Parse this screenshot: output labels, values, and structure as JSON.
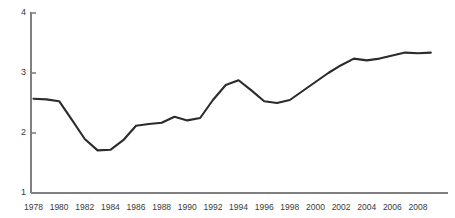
{
  "chart_data": {
    "type": "line",
    "title": "",
    "subtitle": "",
    "xlabel": "",
    "ylabel": "",
    "xlim": [
      1978,
      2009
    ],
    "ylim": [
      1,
      4
    ],
    "grid": false,
    "legend": false,
    "legend_position": "none",
    "line_color": "#2b2b2b",
    "axis_color": "#808080",
    "tick_label_color": "#3a3a3a",
    "y_ticks": [
      "1",
      "2",
      "3",
      "4"
    ],
    "y_tick_values": [
      1,
      2,
      3,
      4
    ],
    "x_ticks": [
      "1978",
      "1980",
      "1982",
      "1984",
      "1986",
      "1988",
      "1990",
      "1992",
      "1994",
      "1996",
      "1998",
      "2000",
      "2002",
      "2004",
      "2006",
      "2008"
    ],
    "x_tick_values": [
      1978,
      1980,
      1982,
      1984,
      1986,
      1988,
      1990,
      1992,
      1994,
      1996,
      1998,
      2000,
      2002,
      2004,
      2006,
      2008
    ],
    "x": [
      1978,
      1979,
      1980,
      1981,
      1982,
      1983,
      1984,
      1985,
      1986,
      1987,
      1988,
      1989,
      1990,
      1991,
      1992,
      1993,
      1994,
      1995,
      1996,
      1997,
      1998,
      1999,
      2000,
      2001,
      2002,
      2003,
      2004,
      2005,
      2006,
      2007,
      2008,
      2009
    ],
    "values": [
      2.57,
      2.56,
      2.53,
      2.22,
      1.9,
      1.71,
      1.72,
      1.88,
      2.12,
      2.15,
      2.17,
      2.27,
      2.21,
      2.25,
      2.55,
      2.8,
      2.88,
      2.71,
      2.53,
      2.5,
      2.55,
      2.7,
      2.85,
      3.0,
      3.13,
      3.24,
      3.21,
      3.24,
      3.29,
      3.34,
      3.33,
      3.34
    ],
    "series": [
      {
        "name": "series-1",
        "values": [
          2.57,
          2.56,
          2.53,
          2.22,
          1.9,
          1.71,
          1.72,
          1.88,
          2.12,
          2.15,
          2.17,
          2.27,
          2.21,
          2.25,
          2.55,
          2.8,
          2.88,
          2.71,
          2.53,
          2.5,
          2.55,
          2.7,
          2.85,
          3.0,
          3.13,
          3.24,
          3.21,
          3.24,
          3.29,
          3.34,
          3.33,
          3.34
        ]
      }
    ]
  }
}
